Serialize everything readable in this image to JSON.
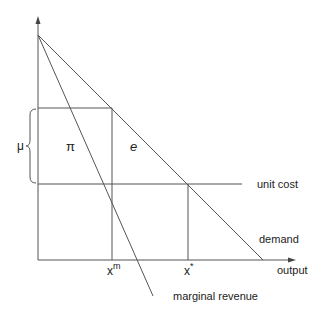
{
  "diagram": {
    "title": "",
    "axes": {
      "x_label": "output",
      "y_label": ""
    },
    "curves": {
      "demand": "demand",
      "marginal_revenue": "marginal revenue",
      "unit_cost": "unit cost"
    },
    "markers": {
      "x_m_base": "x",
      "x_m_sup": "m",
      "x_star_base": "x",
      "x_star_sup": "*"
    },
    "regions": {
      "profit": "π",
      "e": "e",
      "mu": "μ"
    },
    "colors": {
      "line": "#555555",
      "text": "#222222"
    }
  }
}
